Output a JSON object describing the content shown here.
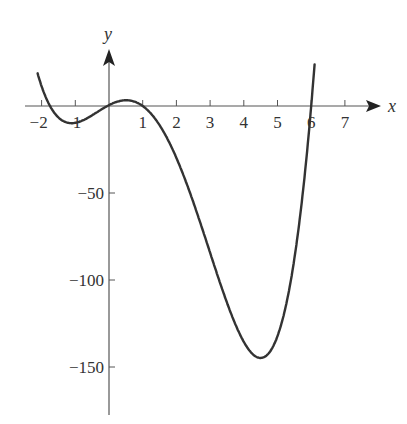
{
  "chart_data": {
    "type": "line",
    "title": "",
    "xlabel": "x",
    "ylabel": "y",
    "xlim": [
      -2.1,
      7.7
    ],
    "ylim": [
      -175,
      30
    ],
    "grid": false,
    "x_ticks": [
      -2,
      -1,
      1,
      2,
      3,
      4,
      5,
      6,
      7
    ],
    "x_tick_labels": [
      "−2",
      "−1",
      "1",
      "2",
      "3",
      "4",
      "5",
      "6",
      "7"
    ],
    "y_ticks": [
      -50,
      -100,
      -150
    ],
    "y_tick_labels": [
      "−50",
      "−100",
      "−150"
    ],
    "series": [
      {
        "name": "f(x)",
        "description": "Quartic-like curve with roots near x = -1.75, 0, 1, 6; local min near x=-1, local max near x=0.45, global min ≈ -148 near x=4.4",
        "x": [
          -2.1,
          -2,
          -1.75,
          -1.5,
          -1,
          -0.5,
          0,
          0.45,
          1,
          1.5,
          2,
          2.5,
          3,
          3.5,
          4,
          4.4,
          5,
          5.5,
          6,
          6.1
        ],
        "y": [
          22,
          15,
          0,
          -9,
          -8,
          -3,
          0,
          3,
          0,
          -12,
          -30,
          -56,
          -85,
          -114,
          -138,
          -148,
          -125,
          -85,
          0,
          12
        ]
      }
    ]
  },
  "axes": {
    "x_label": "x",
    "y_label": "y"
  }
}
